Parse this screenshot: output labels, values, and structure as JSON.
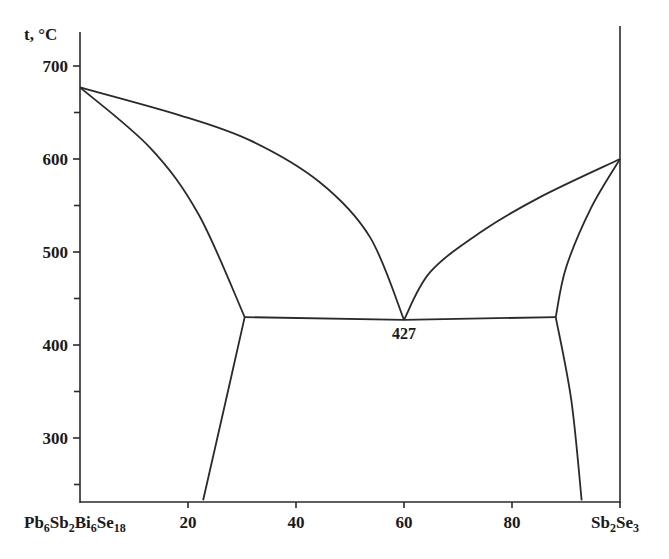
{
  "chart_data": {
    "type": "line",
    "title": "",
    "ylabel": "t, °C",
    "xlabel": "",
    "x_left_component": {
      "base": "Pb",
      "parts": [
        [
          "Pb",
          "6"
        ],
        [
          "Sb",
          "2"
        ],
        [
          "Bi",
          "6"
        ],
        [
          "Se",
          "18"
        ]
      ]
    },
    "x_right_component": {
      "parts": [
        [
          "Sb",
          "2"
        ],
        [
          "Se",
          "3"
        ]
      ]
    },
    "x_left_label": "Pb6Sb2Bi6Se18",
    "x_right_label": "Sb2Se3",
    "xlim": [
      0,
      100
    ],
    "ylim": [
      233,
      733
    ],
    "x_ticks": [
      "20",
      "40",
      "60",
      "80"
    ],
    "y_ticks": [
      "700",
      "600",
      "500",
      "400",
      "300"
    ],
    "y_minor_ticks": [
      650,
      550,
      450,
      350,
      250
    ],
    "grid": false,
    "legend": null,
    "annotations": [
      {
        "text": "427",
        "x": 60,
        "y": 427
      }
    ],
    "melting_points": {
      "left": 677,
      "right": 600
    },
    "eutectic": {
      "x": 60,
      "t": 427
    },
    "series": [
      {
        "name": "liquidus-left",
        "points": [
          [
            0,
            677
          ],
          [
            18.5,
            647
          ],
          [
            31.5,
            620
          ],
          [
            44.4,
            575
          ],
          [
            53.7,
            516
          ],
          [
            60,
            427
          ]
        ]
      },
      {
        "name": "solidus-left",
        "points": [
          [
            0,
            677
          ],
          [
            13,
            612
          ],
          [
            22,
            540
          ],
          [
            30.5,
            430
          ]
        ]
      },
      {
        "name": "eutectic-line",
        "points": [
          [
            30.5,
            430
          ],
          [
            60,
            427
          ],
          [
            88.1,
            430
          ]
        ]
      },
      {
        "name": "liquidus-right",
        "points": [
          [
            60,
            427
          ],
          [
            64.8,
            478
          ],
          [
            74.1,
            521
          ],
          [
            85.2,
            559
          ],
          [
            100,
            600
          ]
        ]
      },
      {
        "name": "solidus-right",
        "points": [
          [
            100,
            600
          ],
          [
            94.6,
            547
          ],
          [
            90,
            483
          ],
          [
            88.1,
            430
          ]
        ]
      },
      {
        "name": "solvus-left",
        "points": [
          [
            30.5,
            430
          ],
          [
            27,
            340
          ],
          [
            22.8,
            233
          ]
        ]
      },
      {
        "name": "solvus-right",
        "points": [
          [
            88.1,
            430
          ],
          [
            91,
            340
          ],
          [
            92.9,
            233
          ]
        ]
      }
    ]
  }
}
